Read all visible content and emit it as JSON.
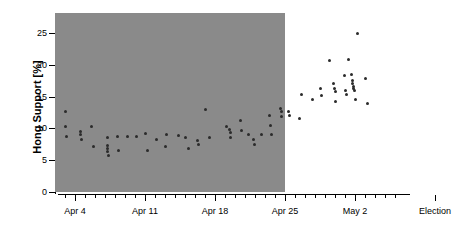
{
  "chart_data": {
    "type": "scatter",
    "title": "",
    "xlabel": "",
    "ylabel": "Hong Support [%]",
    "ylim": [
      0,
      27.5
    ],
    "yticks": [
      0,
      5,
      10,
      15,
      20,
      25
    ],
    "ytick_labels": [
      "0",
      "5",
      "10",
      "15",
      "20",
      "25"
    ],
    "xlim_days": [
      1.5,
      36.5
    ],
    "xtick_labels": [
      "Apr 4",
      "Apr 11",
      "Apr 18",
      "Apr 25",
      "May 2",
      "Election"
    ],
    "xtick_days": [
      4,
      11,
      18,
      25,
      32,
      40
    ],
    "grid": false,
    "legend": null,
    "annotations": [],
    "shaded_region": {
      "label": "campaign period shading",
      "color": "#8a8a8a",
      "x_start_day": 2,
      "x_end_day": 25
    },
    "point_color": "#2b2b2b",
    "series": [
      {
        "name": "Hong support polls",
        "points": [
          {
            "day": 3.0,
            "value": 12.7
          },
          {
            "day": 3.0,
            "value": 10.3
          },
          {
            "day": 3.1,
            "value": 8.7
          },
          {
            "day": 4.5,
            "value": 9.5
          },
          {
            "day": 4.5,
            "value": 9.1
          },
          {
            "day": 4.6,
            "value": 8.3
          },
          {
            "day": 5.6,
            "value": 10.3
          },
          {
            "day": 5.8,
            "value": 7.1
          },
          {
            "day": 7.2,
            "value": 8.5
          },
          {
            "day": 7.2,
            "value": 7.3
          },
          {
            "day": 7.2,
            "value": 6.8
          },
          {
            "day": 7.2,
            "value": 6.3
          },
          {
            "day": 7.3,
            "value": 5.7
          },
          {
            "day": 8.2,
            "value": 8.7
          },
          {
            "day": 8.3,
            "value": 6.5
          },
          {
            "day": 9.2,
            "value": 8.8
          },
          {
            "day": 10.1,
            "value": 8.8
          },
          {
            "day": 11.0,
            "value": 9.2
          },
          {
            "day": 11.2,
            "value": 6.6
          },
          {
            "day": 12.1,
            "value": 8.3
          },
          {
            "day": 13.0,
            "value": 7.1
          },
          {
            "day": 13.1,
            "value": 9.0
          },
          {
            "day": 14.3,
            "value": 8.9
          },
          {
            "day": 15.0,
            "value": 8.5
          },
          {
            "day": 15.3,
            "value": 6.9
          },
          {
            "day": 16.2,
            "value": 8.1
          },
          {
            "day": 16.3,
            "value": 7.4
          },
          {
            "day": 17.0,
            "value": 12.9
          },
          {
            "day": 17.4,
            "value": 8.6
          },
          {
            "day": 19.1,
            "value": 10.3
          },
          {
            "day": 19.4,
            "value": 9.8
          },
          {
            "day": 19.5,
            "value": 9.4
          },
          {
            "day": 19.5,
            "value": 8.5
          },
          {
            "day": 20.5,
            "value": 11.2
          },
          {
            "day": 20.6,
            "value": 9.6
          },
          {
            "day": 21.3,
            "value": 9.0
          },
          {
            "day": 21.8,
            "value": 8.2
          },
          {
            "day": 21.9,
            "value": 7.5
          },
          {
            "day": 22.6,
            "value": 9.0
          },
          {
            "day": 23.4,
            "value": 12.1
          },
          {
            "day": 23.5,
            "value": 10.4
          },
          {
            "day": 23.6,
            "value": 9.1
          },
          {
            "day": 24.5,
            "value": 13.1
          },
          {
            "day": 24.6,
            "value": 12.6
          },
          {
            "day": 24.6,
            "value": 11.9
          },
          {
            "day": 25.3,
            "value": 12.7
          },
          {
            "day": 25.4,
            "value": 12.1
          },
          {
            "day": 26.4,
            "value": 11.6
          },
          {
            "day": 26.6,
            "value": 15.3
          },
          {
            "day": 27.7,
            "value": 14.6
          },
          {
            "day": 28.5,
            "value": 16.3
          },
          {
            "day": 28.6,
            "value": 15.2
          },
          {
            "day": 29.4,
            "value": 20.7
          },
          {
            "day": 29.8,
            "value": 17.1
          },
          {
            "day": 29.9,
            "value": 16.2
          },
          {
            "day": 30.0,
            "value": 15.8
          },
          {
            "day": 30.0,
            "value": 14.3
          },
          {
            "day": 30.9,
            "value": 18.3
          },
          {
            "day": 31.0,
            "value": 16.0
          },
          {
            "day": 31.1,
            "value": 15.3
          },
          {
            "day": 31.3,
            "value": 20.8
          },
          {
            "day": 31.6,
            "value": 18.4
          },
          {
            "day": 31.7,
            "value": 17.6
          },
          {
            "day": 31.7,
            "value": 17.0
          },
          {
            "day": 31.8,
            "value": 16.6
          },
          {
            "day": 31.8,
            "value": 16.2
          },
          {
            "day": 31.9,
            "value": 15.9
          },
          {
            "day": 32.0,
            "value": 14.5
          },
          {
            "day": 32.2,
            "value": 24.9
          },
          {
            "day": 33.0,
            "value": 17.8
          },
          {
            "day": 33.2,
            "value": 13.9
          }
        ]
      }
    ]
  }
}
